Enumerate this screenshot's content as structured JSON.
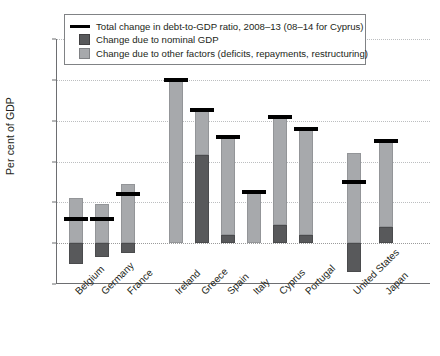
{
  "chart_data": {
    "type": "bar",
    "title": "",
    "xlabel": "",
    "ylabel": "Per cent of GDP",
    "ylim": [
      -20,
      100
    ],
    "yticks": [
      -20,
      0,
      20,
      40,
      60,
      80,
      100
    ],
    "grid": true,
    "legend_position": "top-inside",
    "categories": [
      "Belgium",
      "Germany",
      "France",
      "Ireland",
      "Greece",
      "Spain",
      "Italy",
      "Cyprus",
      "Portugal",
      "United States",
      "Japan"
    ],
    "groups": [
      {
        "name": "group-1",
        "categories": [
          "Belgium",
          "Germany",
          "France"
        ]
      },
      {
        "name": "group-2",
        "categories": [
          "Ireland",
          "Greece",
          "Spain",
          "Italy",
          "Cyprus",
          "Portugal"
        ]
      },
      {
        "name": "group-3",
        "categories": [
          "United States",
          "Japan"
        ]
      }
    ],
    "series": [
      {
        "name": "Change due to other factors (deficits, repayments, restructuring)",
        "key": "other_factors",
        "color": "#a7a9ac",
        "values": [
          22,
          19,
          29,
          80,
          22,
          48,
          25,
          53,
          52,
          44,
          42
        ]
      },
      {
        "name": "Change due to nominal GDP",
        "key": "nominal_gdp",
        "color": "#58595b",
        "values": [
          -10,
          -7,
          -5,
          0,
          43,
          4,
          0,
          9,
          4,
          -14,
          8
        ]
      },
      {
        "name": "Total change in debt-to-GDP ratio, 2008–13 (08–14 for Cyprus)",
        "key": "total_change",
        "color": "#000000",
        "values": [
          12,
          12,
          24,
          80,
          65,
          52,
          25,
          62,
          56,
          30,
          50
        ]
      }
    ],
    "bar_tops": [
      22,
      19,
      29,
      80,
      65,
      52,
      25,
      62,
      56,
      44,
      50
    ],
    "bar_bottoms": [
      -10,
      -7,
      -5,
      0,
      0,
      0,
      0,
      0,
      0,
      -14,
      0
    ],
    "dark_segment_tops": [
      0,
      0,
      0,
      0,
      43,
      4,
      0,
      9,
      4,
      0,
      8
    ]
  },
  "legend": {
    "items": [
      {
        "swatch": "line-swatch",
        "label": "Total change in debt-to-GDP ratio, 2008–13 (08–14 for Cyprus)"
      },
      {
        "swatch": "dark-square-swatch",
        "label": "Change due to nominal GDP"
      },
      {
        "swatch": "light-square-swatch",
        "label": "Change due to other factors (deficits, repayments, restructuring)"
      }
    ]
  },
  "axis": {
    "y_label": "Per cent of GDP",
    "y_ticks": [
      "100",
      "80",
      "60",
      "40",
      "20",
      "0",
      "–20"
    ]
  }
}
